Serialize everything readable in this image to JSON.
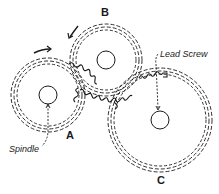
{
  "diagram": {
    "gears": [
      {
        "id": "A",
        "label": "A",
        "cx": 48,
        "cy": 95,
        "outer_r": 37,
        "hub_r": 9,
        "role": "spindle gear"
      },
      {
        "id": "B",
        "label": "B",
        "cx": 106,
        "cy": 60,
        "outer_r": 36,
        "hub_r": 9,
        "role": "idler gear"
      },
      {
        "id": "C",
        "label": "C",
        "cx": 160,
        "cy": 120,
        "outer_r": 52,
        "hub_r": 9,
        "role": "lead screw gear"
      }
    ],
    "annotations": {
      "spindle": "Spindle",
      "lead_screw": "Lead Screw"
    },
    "arrows": [
      {
        "name": "rotation-arrow-a",
        "direction": "clockwise"
      },
      {
        "name": "rotation-arrow-b",
        "direction": "counter-clockwise"
      }
    ],
    "line_color": "#1a1a1a",
    "background": "#ffffff"
  }
}
